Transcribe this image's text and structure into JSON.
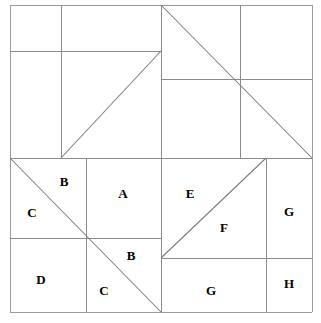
{
  "figure": {
    "canvas": {
      "width": 321,
      "height": 323,
      "background": "#ffffff"
    },
    "stroke_color": "#8a8a8a",
    "label_color": "#000000",
    "outer_square": {
      "x1": 10,
      "y1": 5,
      "x2": 312,
      "y2": 312
    },
    "labels": [
      {
        "id": "label-b-upper-left",
        "text": "B",
        "x": 64,
        "y": 181
      },
      {
        "id": "label-c-left",
        "text": "C",
        "x": 32,
        "y": 212
      },
      {
        "id": "label-a",
        "text": "A",
        "x": 123,
        "y": 193
      },
      {
        "id": "label-e",
        "text": "E",
        "x": 190,
        "y": 193
      },
      {
        "id": "label-g-right-upper",
        "text": "G",
        "x": 289,
        "y": 211
      },
      {
        "id": "label-f",
        "text": "F",
        "x": 224,
        "y": 227
      },
      {
        "id": "label-b-lower",
        "text": "B",
        "x": 131,
        "y": 255
      },
      {
        "id": "label-d",
        "text": "D",
        "x": 41,
        "y": 279
      },
      {
        "id": "label-c-lower",
        "text": "C",
        "x": 104,
        "y": 290
      },
      {
        "id": "label-g-bottom",
        "text": "G",
        "x": 211,
        "y": 290
      },
      {
        "id": "label-h",
        "text": "H",
        "x": 289,
        "y": 283
      }
    ],
    "straight_lines": [
      {
        "id": "outer-top",
        "x1": 10,
        "y1": 5,
        "x2": 312,
        "y2": 5
      },
      {
        "id": "outer-left",
        "x1": 10,
        "y1": 5,
        "x2": 10,
        "y2": 312
      },
      {
        "id": "outer-right",
        "x1": 312,
        "y1": 5,
        "x2": 312,
        "y2": 312
      },
      {
        "id": "outer-bottom",
        "x1": 10,
        "y1": 312,
        "x2": 312,
        "y2": 312
      },
      {
        "id": "center-horizontal",
        "x1": 10,
        "y1": 158,
        "x2": 312,
        "y2": 158
      },
      {
        "id": "center-vertical",
        "x1": 161,
        "y1": 5,
        "x2": 161,
        "y2": 312
      },
      {
        "id": "tl-vertical",
        "x1": 61,
        "y1": 5,
        "x2": 61,
        "y2": 158
      },
      {
        "id": "tl-horizontal",
        "x1": 10,
        "y1": 51,
        "x2": 161,
        "y2": 51
      },
      {
        "id": "tr-vertical",
        "x1": 240,
        "y1": 5,
        "x2": 240,
        "y2": 158
      },
      {
        "id": "tr-horizontal",
        "x1": 161,
        "y1": 79,
        "x2": 312,
        "y2": 79
      },
      {
        "id": "bl-vertical",
        "x1": 86,
        "y1": 158,
        "x2": 86,
        "y2": 312
      },
      {
        "id": "bl-horizontal",
        "x1": 10,
        "y1": 238,
        "x2": 161,
        "y2": 238
      },
      {
        "id": "br-vertical",
        "x1": 266,
        "y1": 158,
        "x2": 266,
        "y2": 312
      },
      {
        "id": "br-horizontal",
        "x1": 161,
        "y1": 258,
        "x2": 312,
        "y2": 258
      }
    ],
    "diagonal_lines": [
      {
        "id": "diagonal-top-left-piece",
        "x1": 61,
        "y1": 158,
        "x2": 161,
        "y2": 51
      },
      {
        "id": "diagonal-top-right-large",
        "x1": 161,
        "y1": 5,
        "x2": 312,
        "y2": 158
      },
      {
        "id": "diagonal-bottom-left",
        "x1": 10,
        "y1": 158,
        "x2": 161,
        "y2": 312
      },
      {
        "id": "diagonal-bottom-right",
        "x1": 161,
        "y1": 258,
        "x2": 266,
        "y2": 158
      }
    ]
  }
}
